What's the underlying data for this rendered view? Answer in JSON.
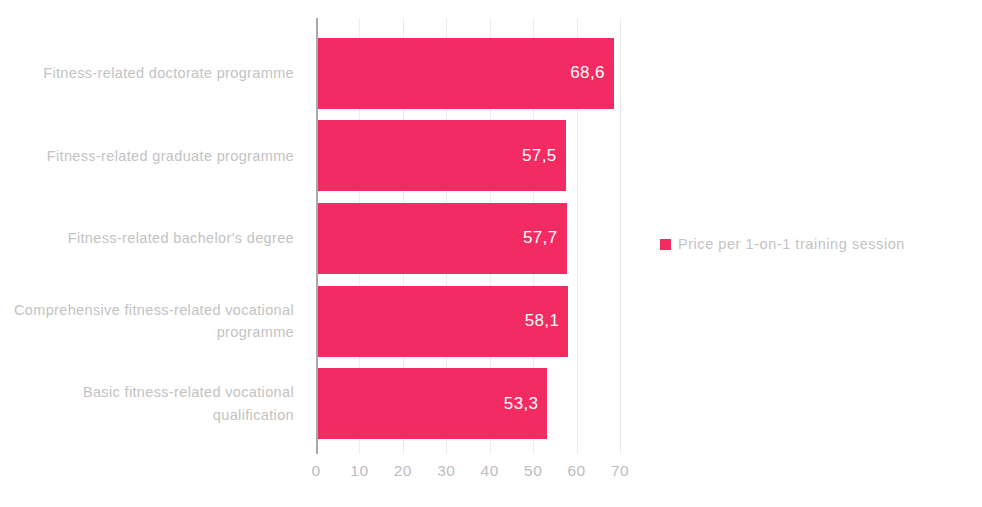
{
  "chart_data": {
    "type": "bar",
    "orientation": "horizontal",
    "title": "",
    "xlabel": "",
    "ylabel": "",
    "xlim": [
      0,
      70
    ],
    "grid": true,
    "legend_position": "right",
    "categories": [
      "Fitness-related doctorate programme",
      "Fitness-related graduate programme",
      "Fitness-related bachelor's degree",
      "Comprehensive fitness-related vocational programme",
      "Basic fitness-related vocational qualification"
    ],
    "series": [
      {
        "name": "Price per 1-on-1 training session",
        "values": [
          68.6,
          57.5,
          57.7,
          58.1,
          53.3
        ],
        "value_labels": [
          "68,6",
          "57,5",
          "57,7",
          "58,1",
          "53,3"
        ],
        "color": "#f22b63"
      }
    ],
    "xticks": [
      0,
      10,
      20,
      30,
      40,
      50,
      60,
      70
    ],
    "xtick_labels": [
      "0",
      "10",
      "20",
      "30",
      "40",
      "50",
      "60",
      "70"
    ]
  },
  "legend": {
    "entries": [
      {
        "label": "Price per 1-on-1 training session",
        "color": "#f22b63"
      }
    ]
  },
  "colors": {
    "bar": "#f22b63",
    "axis_line": "#a9a9a9",
    "gridline": "#ececec",
    "label_text": "#c3c3c3",
    "tick_text": "#bdbdbd",
    "value_text": "#ffffff",
    "background": "#ffffff"
  }
}
